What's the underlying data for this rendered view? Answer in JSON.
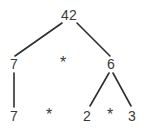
{
  "diagram": {
    "type": "expression-tree",
    "background_color": "#ffffff",
    "text_color": "#3a3a3a",
    "edge_color": "#2e2e2e",
    "levels": [
      {
        "level": 0,
        "nodes": [
          {
            "id": "root",
            "label": "42",
            "kind": "value",
            "x": 69,
            "y": 15
          }
        ]
      },
      {
        "level": 1,
        "nodes": [
          {
            "id": "left1",
            "label": "7",
            "kind": "value",
            "x": 14,
            "y": 64
          },
          {
            "id": "op1",
            "label": "*",
            "kind": "operator",
            "x": 63,
            "y": 63
          },
          {
            "id": "right1",
            "label": "6",
            "kind": "value",
            "x": 111,
            "y": 64
          }
        ]
      },
      {
        "level": 2,
        "nodes": [
          {
            "id": "leaf1",
            "label": "7",
            "kind": "value",
            "x": 14,
            "y": 116
          },
          {
            "id": "op2",
            "label": "*",
            "kind": "operator",
            "x": 49,
            "y": 115
          },
          {
            "id": "leaf2",
            "label": "2",
            "kind": "value",
            "x": 87,
            "y": 116
          },
          {
            "id": "op3",
            "label": "*",
            "kind": "operator",
            "x": 110,
            "y": 115
          },
          {
            "id": "leaf3",
            "label": "3",
            "kind": "value",
            "x": 132,
            "y": 116
          }
        ]
      }
    ],
    "edges": [
      {
        "id": "edge-root-left",
        "from": "root",
        "to": "left1",
        "x1": 62,
        "y1": 23,
        "x2": 15,
        "y2": 56
      },
      {
        "id": "edge-root-right",
        "from": "root",
        "to": "right1",
        "x1": 77,
        "y1": 23,
        "x2": 110,
        "y2": 56
      },
      {
        "id": "edge-left-leaf",
        "from": "left1",
        "to": "leaf1",
        "x1": 14,
        "y1": 73,
        "x2": 14,
        "y2": 107
      },
      {
        "id": "edge-right-leaf2",
        "from": "right1",
        "to": "leaf2",
        "x1": 109,
        "y1": 73,
        "x2": 90,
        "y2": 106
      },
      {
        "id": "edge-right-leaf3",
        "from": "right1",
        "to": "leaf3",
        "x1": 113,
        "y1": 73,
        "x2": 131,
        "y2": 106
      }
    ]
  }
}
